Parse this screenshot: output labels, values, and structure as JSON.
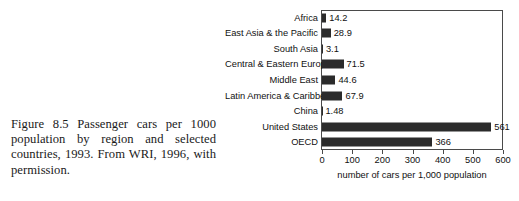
{
  "caption": {
    "text": "Figure 8.5 Passenger cars per 1000 population by region and selected countries, 1993. From WRI, 1996, with permission."
  },
  "chart_data": {
    "type": "bar",
    "orientation": "horizontal",
    "title": "",
    "xlabel": "number of cars per 1,000 population",
    "ylabel": "",
    "xlim": [
      0,
      600
    ],
    "xticks": [
      0,
      100,
      200,
      300,
      400,
      500,
      600
    ],
    "xtick_labels": [
      "0",
      "100",
      "200",
      "300",
      "400",
      "500",
      "600"
    ],
    "grid": false,
    "legend": false,
    "bar_color": "#2b2b2b",
    "frame_color": "#4a4a4a",
    "categories": [
      "Africa",
      "East Asia & the Pacific",
      "South Asia",
      "Central & Eastern Europe",
      "Middle East",
      "Latin America & Caribbean",
      "China",
      "United States",
      "OECD"
    ],
    "values": [
      14.2,
      28.9,
      3.1,
      71.5,
      44.6,
      67.9,
      1.48,
      561,
      366
    ],
    "value_labels": [
      "14.2",
      "28.9",
      "3.1",
      "71.5",
      "44.6",
      "67.9",
      "1.48",
      "561",
      "366"
    ]
  }
}
